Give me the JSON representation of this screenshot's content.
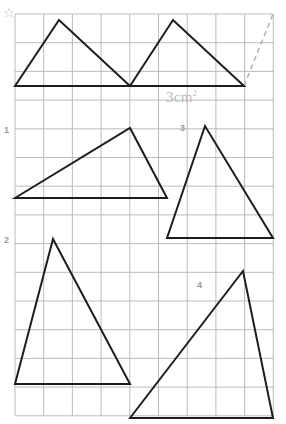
{
  "page": {
    "background_color": "#ffffff",
    "width": 286,
    "height": 424
  },
  "star_icon": {
    "name": "star-icon",
    "color": "#d8d8d8"
  },
  "grid": {
    "origin_x": 15,
    "origin_y": 14,
    "cell_size": 28.7,
    "columns": 9,
    "rows": 14,
    "line_color": "#b4b4b4",
    "line_width": 0.9
  },
  "annotations": {
    "area_label": {
      "value": "3cm",
      "exponent": "2",
      "x": 166,
      "y": 90,
      "color": "#b9b9b9"
    },
    "numbers": [
      {
        "label": "1",
        "x": 4,
        "y": 126
      },
      {
        "label": "2",
        "x": 4,
        "y": 236
      },
      {
        "label": "3",
        "x": 180,
        "y": 124
      },
      {
        "label": "4",
        "x": 197,
        "y": 281
      }
    ],
    "number_color": "#9a9a9a"
  },
  "shapes": {
    "stroke_color": "#1d1d1d",
    "stroke_width": 2,
    "triangles": [
      {
        "name": "triangle-top-left",
        "points": "15,86 59,20 130,86"
      },
      {
        "name": "triangle-top-right",
        "points": "130,86 173,20 244,86"
      },
      {
        "name": "triangle-middle-left",
        "points": "15,198 130,128 167,198"
      },
      {
        "name": "triangle-middle-right",
        "points": "167,238 205,126 273,238"
      },
      {
        "name": "triangle-bottom-left",
        "points": "15,384 53,239 130,384"
      },
      {
        "name": "triangle-bottom-right",
        "points": "130,418 243,271 273,418"
      }
    ],
    "dashed_line": {
      "name": "dashed-diagonal",
      "x1": 244,
      "y1": 86,
      "x2": 273,
      "y2": 14,
      "color": "#b4b4b4",
      "dash": "5,4",
      "width": 1.6
    }
  }
}
